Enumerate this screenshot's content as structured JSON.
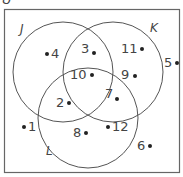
{
  "diagram": {
    "type": "venn",
    "universal_label": "U",
    "sets": [
      {
        "name": "J",
        "cx": 63,
        "cy": 72,
        "r": 50
      },
      {
        "name": "K",
        "cx": 113,
        "cy": 72,
        "r": 50
      },
      {
        "name": "L",
        "cx": 88,
        "cy": 118,
        "r": 50
      }
    ],
    "elements": [
      {
        "label": "4",
        "regions": [
          "J"
        ]
      },
      {
        "label": "3",
        "regions": [
          "J",
          "K"
        ]
      },
      {
        "label": "11",
        "regions": [
          "K"
        ]
      },
      {
        "label": "5",
        "regions": []
      },
      {
        "label": "10",
        "regions": [
          "J",
          "K",
          "L"
        ]
      },
      {
        "label": "9",
        "regions": [
          "K"
        ]
      },
      {
        "label": "2",
        "regions": [
          "J",
          "L"
        ]
      },
      {
        "label": "7",
        "regions": [
          "K",
          "L"
        ]
      },
      {
        "label": "1",
        "regions": []
      },
      {
        "label": "8",
        "regions": [
          "L"
        ]
      },
      {
        "label": "12",
        "regions": [
          "L"
        ]
      },
      {
        "label": "6",
        "regions": []
      }
    ]
  },
  "labels": {
    "U": "U",
    "J": "J",
    "K": "K",
    "L": "L",
    "e4": "4",
    "e3": "3",
    "e11": "11",
    "e5": "5",
    "e10": "10",
    "e9": "9",
    "e2": "2",
    "e7": "7",
    "e1": "1",
    "e8": "8",
    "e12": "12",
    "e6": "6"
  },
  "colors": {
    "stroke": "#555555",
    "text": "#444444",
    "dot": "#222222"
  }
}
